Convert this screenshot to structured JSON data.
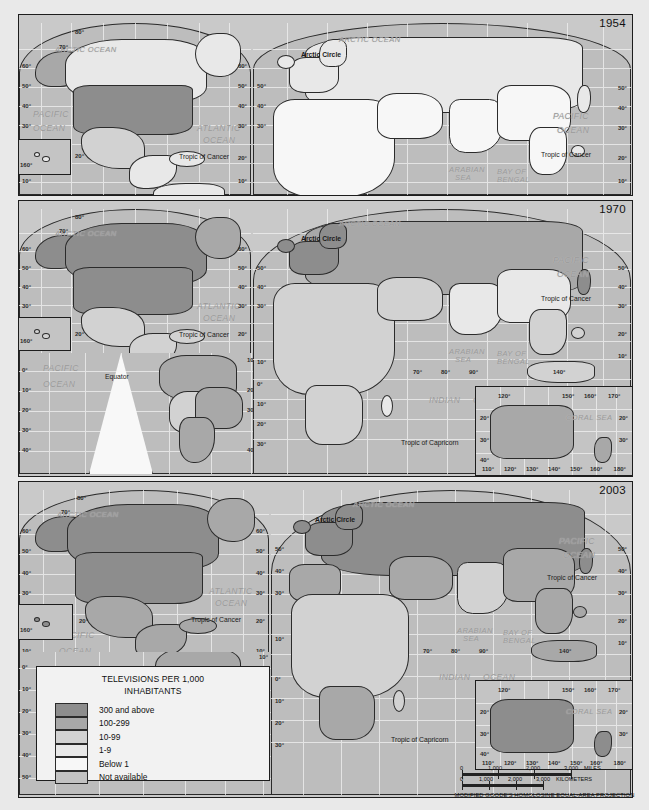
{
  "document": {
    "type": "thematic-world-map-series",
    "projection_note": "MODIFIED GOODE'S HOMOLOSINE EQUAL-AREA PROJECTION"
  },
  "panels": [
    {
      "year": "1954"
    },
    {
      "year": "1970"
    },
    {
      "year": "2003"
    }
  ],
  "legend": {
    "title_line1": "TELEVISIONS PER 1,000",
    "title_line2": "INHABITANTS",
    "entries": [
      {
        "label": "300 and above",
        "color": "#8d8d8d"
      },
      {
        "label": "100-299",
        "color": "#a8a8a8"
      },
      {
        "label": "10-99",
        "color": "#d2d2d2"
      },
      {
        "label": "1-9",
        "color": "#e8e8e8"
      },
      {
        "label": "Below 1",
        "color": "#f7f7f7"
      },
      {
        "label": "Not available",
        "color": "#c2c2c2"
      }
    ]
  },
  "scale": {
    "miles": {
      "ticks": [
        "0",
        "1,000",
        "2,000",
        "3,000"
      ],
      "unit": "MILES"
    },
    "kilometers": {
      "ticks": [
        "0",
        "1,000",
        "2,000",
        "3,000"
      ],
      "unit": "KILOMETERS"
    },
    "projection": "MODIFIED GOODE'S HOMOLOSINE EQUAL-AREA PROJECTION"
  },
  "map_labels": {
    "oceans": [
      "PACIFIC OCEAN",
      "ATLANTIC OCEAN",
      "ARCTIC OCEAN",
      "INDIAN OCEAN"
    ],
    "seas": [
      "ARABIAN SEA",
      "BAY OF BENGAL",
      "CORAL SEA"
    ],
    "lines": [
      "Arctic Circle",
      "Tropic of Cancer",
      "Tropic of Capricorn",
      "Equator"
    ],
    "pacific": "PACIFIC",
    "pacific2": "OCEAN",
    "atlantic": "ATLANTIC",
    "atlantic2": "OCEAN",
    "arctic_ocean": "ARCTIC OCEAN",
    "arctic_circle": "Arctic Circle",
    "tropic_cancer": "Tropic of Cancer",
    "tropic_capricorn": "Tropic of Capricorn",
    "equator": "Equator",
    "indian": "INDIAN",
    "indian2": "OCEAN",
    "arabian": "ARABIAN",
    "arabian2": "SEA",
    "bengal": "BAY OF",
    "bengal2": "BENGAL",
    "coral": "CORAL  SEA"
  },
  "graticule": {
    "lat_left": [
      "80",
      "70",
      "60",
      "50",
      "40",
      "30",
      "20",
      "10"
    ],
    "lat_right": [
      "60",
      "50",
      "40",
      "30",
      "20",
      "10"
    ],
    "lat_south": [
      "0",
      "10",
      "20",
      "30",
      "40",
      "50"
    ],
    "lon_indian": [
      "70",
      "80",
      "90",
      "140"
    ],
    "australia_lon_top": [
      "120",
      "150",
      "160",
      "170"
    ],
    "australia_lon_bottom": [
      "110",
      "120",
      "130",
      "140",
      "150",
      "160",
      "180"
    ],
    "australia_lat": [
      "20",
      "30",
      "40"
    ],
    "hawaii_lon": "160",
    "hawaii_lat": "20"
  }
}
